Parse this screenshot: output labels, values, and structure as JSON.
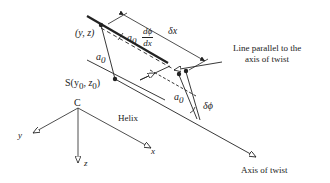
{
  "diagram": {
    "labels": {
      "point_yz": "(y, z)",
      "point_s": "S(y",
      "point_s_sub0": "0",
      "point_s_mid": ", z",
      "point_s_sub1": "0",
      "point_s_close": ")",
      "a0_left": "a",
      "a0_left_sub": "0",
      "a0_top": "a",
      "a0_top_sub": "0",
      "dphi_num": "dϕ",
      "dphi_den": "dx",
      "delta_x": "δx",
      "line_parallel_1": "Line parallel to the",
      "line_parallel_2": "axis of twist",
      "a0_right": "a",
      "a0_right_sub": "0",
      "delta_phi": "δϕ",
      "helix": "Helix",
      "axis_of_twist": "Axis of twist",
      "origin": "C",
      "axis_x": "x",
      "axis_y": "y",
      "axis_z": "z"
    },
    "colors": {
      "stroke": "#222222",
      "background": "#ffffff"
    }
  }
}
